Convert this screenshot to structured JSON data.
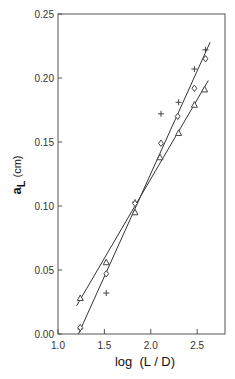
{
  "chart_data": {
    "type": "scatter",
    "title": "",
    "xlabel": "log  (L / D)",
    "ylabel": "a_L (cm)",
    "ylabel_main": "a",
    "ylabel_sub": "L",
    "ylabel_unit": "(cm)",
    "xlim": [
      1.0,
      2.8
    ],
    "ylim": [
      0.0,
      0.25
    ],
    "grid": false,
    "legend": "none",
    "x_ticks": [
      1.0,
      1.5,
      2.0,
      2.5
    ],
    "x_tick_labels": [
      "1.0",
      "1.5",
      "2.0",
      "2.5"
    ],
    "y_ticks": [
      0.0,
      0.05,
      0.1,
      0.15,
      0.2,
      0.25
    ],
    "y_tick_labels": [
      "0.00",
      "0.05",
      "0.10",
      "0.15",
      "0.20",
      "0.25"
    ],
    "series": [
      {
        "name": "plus",
        "marker": "+",
        "x": [
          1.24,
          1.52,
          1.83,
          2.11,
          2.3,
          2.47,
          2.59
        ],
        "y": [
          0.004,
          0.032,
          0.103,
          0.172,
          0.181,
          0.207,
          0.222
        ]
      },
      {
        "name": "diamond",
        "marker": "diamond",
        "x": [
          1.24,
          1.52,
          1.83,
          2.11,
          2.29,
          2.47,
          2.59
        ],
        "y": [
          0.005,
          0.047,
          0.102,
          0.149,
          0.17,
          0.192,
          0.215
        ]
      },
      {
        "name": "triangle",
        "marker": "triangle",
        "x": [
          1.24,
          1.52,
          1.83,
          2.1,
          2.3,
          2.47,
          2.58
        ],
        "y": [
          0.028,
          0.056,
          0.095,
          0.138,
          0.157,
          0.179,
          0.191
        ]
      }
    ],
    "fit_lines": [
      {
        "name": "fit-upper",
        "x": [
          1.22,
          2.64
        ],
        "y": [
          0.0,
          0.228
        ]
      },
      {
        "name": "fit-lower",
        "x": [
          1.2,
          2.62
        ],
        "y": [
          0.022,
          0.198
        ]
      }
    ]
  }
}
